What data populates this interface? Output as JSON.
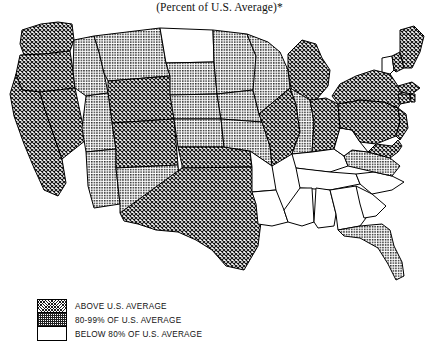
{
  "figure": {
    "title": "(Percent of U.S. Average)*",
    "type": "choropleth-map",
    "region": "United States (contiguous 48 states)"
  },
  "legend": {
    "items": [
      {
        "key": "above",
        "label": "ABOVE U.S. AVERAGE",
        "pattern": "dense-crosshatch",
        "color": "#1a1a1a"
      },
      {
        "key": "mid",
        "label": "80-99% OF U.S. AVERAGE",
        "pattern": "fine-dot-grid",
        "color": "#9a9a9a"
      },
      {
        "key": "below",
        "label": "BELOW 80% OF U.S. AVERAGE",
        "pattern": "none-white",
        "color": "#ffffff"
      }
    ]
  },
  "chart_data": {
    "type": "map",
    "title": "(Percent of U.S. Average)*",
    "categories": [
      "ABOVE U.S. AVERAGE",
      "80-99% OF U.S. AVERAGE",
      "BELOW 80% OF U.S. AVERAGE"
    ],
    "legend_position": "bottom-left",
    "states": [
      {
        "code": "WA",
        "name": "Washington",
        "class": "above"
      },
      {
        "code": "OR",
        "name": "Oregon",
        "class": "above"
      },
      {
        "code": "CA",
        "name": "California",
        "class": "above"
      },
      {
        "code": "NV",
        "name": "Nevada",
        "class": "above"
      },
      {
        "code": "ID",
        "name": "Idaho",
        "class": "mid"
      },
      {
        "code": "MT",
        "name": "Montana",
        "class": "mid"
      },
      {
        "code": "WY",
        "name": "Wyoming",
        "class": "above"
      },
      {
        "code": "UT",
        "name": "Utah",
        "class": "mid"
      },
      {
        "code": "AZ",
        "name": "Arizona",
        "class": "mid"
      },
      {
        "code": "CO",
        "name": "Colorado",
        "class": "above"
      },
      {
        "code": "NM",
        "name": "New Mexico",
        "class": "mid"
      },
      {
        "code": "ND",
        "name": "North Dakota",
        "class": "below"
      },
      {
        "code": "SD",
        "name": "South Dakota",
        "class": "mid"
      },
      {
        "code": "NE",
        "name": "Nebraska",
        "class": "mid"
      },
      {
        "code": "KS",
        "name": "Kansas",
        "class": "mid"
      },
      {
        "code": "OK",
        "name": "Oklahoma",
        "class": "above"
      },
      {
        "code": "TX",
        "name": "Texas",
        "class": "above"
      },
      {
        "code": "MN",
        "name": "Minnesota",
        "class": "mid"
      },
      {
        "code": "IA",
        "name": "Iowa",
        "class": "mid"
      },
      {
        "code": "MO",
        "name": "Missouri",
        "class": "mid"
      },
      {
        "code": "AR",
        "name": "Arkansas",
        "class": "below"
      },
      {
        "code": "LA",
        "name": "Louisiana",
        "class": "below"
      },
      {
        "code": "WI",
        "name": "Wisconsin",
        "class": "mid"
      },
      {
        "code": "IL",
        "name": "Illinois",
        "class": "above"
      },
      {
        "code": "MI",
        "name": "Michigan",
        "class": "above"
      },
      {
        "code": "IN",
        "name": "Indiana",
        "class": "mid"
      },
      {
        "code": "OH",
        "name": "Ohio",
        "class": "above"
      },
      {
        "code": "KY",
        "name": "Kentucky",
        "class": "below"
      },
      {
        "code": "TN",
        "name": "Tennessee",
        "class": "below"
      },
      {
        "code": "MS",
        "name": "Mississippi",
        "class": "below"
      },
      {
        "code": "AL",
        "name": "Alabama",
        "class": "below"
      },
      {
        "code": "GA",
        "name": "Georgia",
        "class": "below"
      },
      {
        "code": "FL",
        "name": "Florida",
        "class": "mid"
      },
      {
        "code": "SC",
        "name": "South Carolina",
        "class": "below"
      },
      {
        "code": "NC",
        "name": "North Carolina",
        "class": "below"
      },
      {
        "code": "VA",
        "name": "Virginia",
        "class": "mid"
      },
      {
        "code": "WV",
        "name": "West Virginia",
        "class": "below"
      },
      {
        "code": "MD",
        "name": "Maryland",
        "class": "above"
      },
      {
        "code": "DE",
        "name": "Delaware",
        "class": "above"
      },
      {
        "code": "PA",
        "name": "Pennsylvania",
        "class": "above"
      },
      {
        "code": "NJ",
        "name": "New Jersey",
        "class": "above"
      },
      {
        "code": "NY",
        "name": "New York",
        "class": "above"
      },
      {
        "code": "CT",
        "name": "Connecticut",
        "class": "above"
      },
      {
        "code": "RI",
        "name": "Rhode Island",
        "class": "above"
      },
      {
        "code": "MA",
        "name": "Massachusetts",
        "class": "above"
      },
      {
        "code": "VT",
        "name": "Vermont",
        "class": "below"
      },
      {
        "code": "NH",
        "name": "New Hampshire",
        "class": "above"
      },
      {
        "code": "ME",
        "name": "Maine",
        "class": "above"
      }
    ]
  }
}
